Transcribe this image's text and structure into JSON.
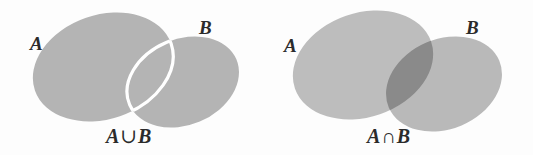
{
  "figure": {
    "background_color": "#fdfdfd",
    "width": 533,
    "height": 155
  },
  "colors": {
    "fill_plain": "#b4b4b4",
    "fill_a_right": "#bdbdbd",
    "fill_b_right": "#b9b9b9",
    "fill_intersection": "#8a8a8a",
    "outline_highlight": "#ffffff",
    "text": "#2b2b2b"
  },
  "panels": [
    {
      "id": "union",
      "caption_set_a": "A",
      "caption_operator": "∪",
      "caption_set_b": "B",
      "labels": {
        "set_a": "A",
        "set_b": "B"
      },
      "highlighted_region": "A ∪ B",
      "description": "Both ellipses shaded; the lens-shaped overlap is outlined in white."
    },
    {
      "id": "intersection",
      "caption_set_a": "A",
      "caption_operator": "∩",
      "caption_set_b": "B",
      "labels": {
        "set_a": "A",
        "set_b": "B"
      },
      "highlighted_region": "A ∩ B",
      "description": "Both ellipses lightly shaded; the lens-shaped overlap is shaded darker."
    }
  ]
}
